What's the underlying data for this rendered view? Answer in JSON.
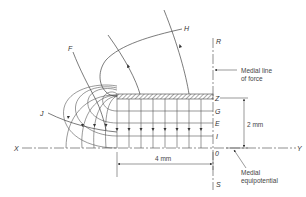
{
  "diagram": {
    "line_labels": {
      "F": "F",
      "H": "H",
      "J": "J",
      "R": "R",
      "S": "S",
      "X": "X",
      "Y": "Y"
    },
    "equipotential_labels": {
      "Z": "Z",
      "G": "G",
      "E": "E",
      "I": "I",
      "O": "0"
    },
    "annotations": {
      "medial_line_of_force": [
        "Medial line",
        "of force"
      ],
      "medial_equipotential": [
        "Medial",
        "equipotential"
      ]
    },
    "dimensions": {
      "vertical": "2 mm",
      "horizontal": "4 mm"
    },
    "colors": {
      "line": "#444444",
      "hatch": "#555555",
      "background": "#ffffff"
    }
  }
}
